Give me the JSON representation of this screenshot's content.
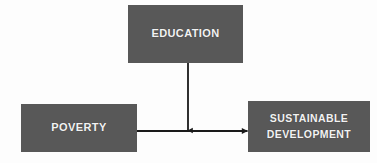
{
  "diagram": {
    "background_color": "#fdfdfd",
    "node_fill_color": "#585858",
    "node_text_color": "#f2f2f2",
    "connector_color": "#1a1a1a",
    "nodes": [
      {
        "id": "education",
        "label": "EDUCATION",
        "position": "top-center"
      },
      {
        "id": "poverty",
        "label": "POVERTY",
        "position": "left"
      },
      {
        "id": "sustainable_development",
        "label": "SUSTAINABLE\nDEVELOPMENT",
        "position": "right"
      }
    ],
    "connectors": [
      {
        "id": "education-to-link",
        "from": "education",
        "to": "poverty-to-sustainable-development",
        "direction": "down",
        "arrowhead": "end"
      },
      {
        "id": "poverty-to-sustainable-development",
        "from": "poverty",
        "to": "sustainable_development",
        "direction": "right",
        "arrowhead": "end"
      }
    ]
  }
}
